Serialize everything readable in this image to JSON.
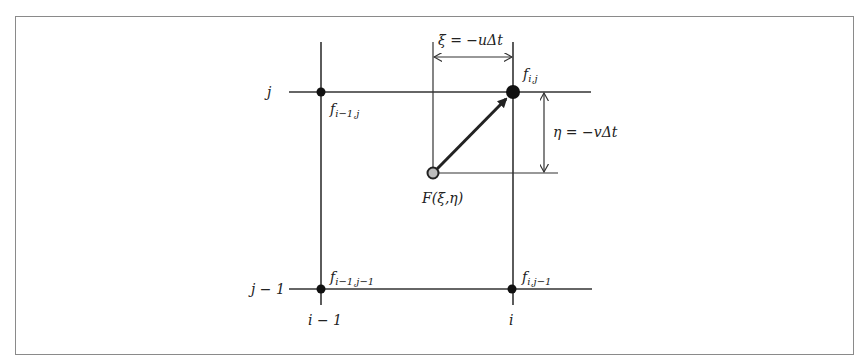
{
  "diagram": {
    "grid_labels": {
      "row_j": "j",
      "row_j_minus_1": "j − 1",
      "col_i_minus_1": "i − 1",
      "col_i": "i"
    },
    "nodes": [
      {
        "id": "f_im1_j",
        "label_base": "f",
        "label_sub": "i−1,j"
      },
      {
        "id": "f_i_j",
        "label_base": "f",
        "label_sub": "i,j"
      },
      {
        "id": "f_im1_jm1",
        "label_base": "f",
        "label_sub": "i−1,j−1"
      },
      {
        "id": "f_i_jm1",
        "label_base": "f",
        "label_sub": "i,j−1"
      }
    ],
    "departure_point": {
      "label": "F(ξ,η)"
    },
    "dimensions": {
      "xi": "ξ = −uΔt",
      "eta": "η = −vΔt"
    },
    "colors": {
      "line": "#333333",
      "node": "#111111",
      "departure_fill": "#bdbdbd",
      "frame": "#8a8a8a"
    }
  }
}
